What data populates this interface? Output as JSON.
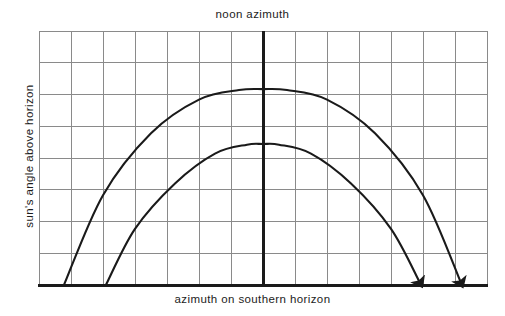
{
  "figure": {
    "type": "diagram",
    "title_top": "noon azimuth",
    "x_axis_label": "azimuth on southern horizon",
    "y_axis_label": "sun's angle above horizon",
    "background_color": "#ffffff",
    "grid": {
      "visible": true,
      "columns": 14,
      "rows": 8,
      "line_color": "#8a8a8a",
      "left": 39,
      "right": 487,
      "top": 31,
      "bottom": 285
    },
    "axes": {
      "horizon_baseline_color": "#1a1a1a",
      "horizon_baseline_thickness": 3,
      "noon_line_color": "#1a1a1a",
      "noon_line_thickness": 3,
      "noon_line_x": 263
    },
    "curves": [
      {
        "name": "summer-sun-path",
        "description": "upper sun path arc, higher maximum altitude, longer day",
        "color": "#1a1a1a",
        "stroke_width": 2.1,
        "start_x": 64,
        "start_y": 285,
        "apex_x": 263,
        "apex_y": 89,
        "end_x": 461,
        "end_y": 283,
        "has_arrowhead": true
      },
      {
        "name": "winter-sun-path",
        "description": "lower sun path arc, lower maximum altitude, shorter day",
        "color": "#1a1a1a",
        "stroke_width": 2.1,
        "start_x": 106,
        "start_y": 285,
        "apex_x": 263,
        "apex_y": 144,
        "end_x": 420,
        "end_y": 283,
        "has_arrowhead": true
      }
    ]
  },
  "chart_data": {
    "type": "line",
    "title": "noon azimuth",
    "xlabel": "azimuth on southern horizon",
    "ylabel": "sun's angle above horizon",
    "grid": true,
    "legend": "none",
    "xlim": [
      0,
      14
    ],
    "ylim": [
      0,
      8
    ],
    "xticklabels": [],
    "yticklabels": [],
    "series": [
      {
        "name": "summer-sun-path",
        "x": [
          0.78,
          2.0,
          3.5,
          5.0,
          6.25,
          7.0,
          7.75,
          9.0,
          10.5,
          12.0,
          13.19
        ],
        "y": [
          0.0,
          2.83,
          4.78,
          5.84,
          6.14,
          6.17,
          6.14,
          5.84,
          4.78,
          2.83,
          0.06
        ]
      },
      {
        "name": "winter-sun-path",
        "x": [
          2.09,
          3.0,
          4.25,
          5.5,
          6.5,
          7.0,
          7.5,
          8.5,
          9.75,
          11.0,
          11.91
        ],
        "y": [
          0.0,
          1.77,
          3.2,
          4.14,
          4.42,
          4.44,
          4.42,
          4.14,
          3.2,
          1.77,
          0.06
        ]
      }
    ],
    "annotations": [
      {
        "text": "noon azimuth",
        "x": 7.0,
        "y": 8.6,
        "type": "top-label"
      },
      {
        "text": "arrowhead",
        "x": 13.19,
        "y": 0.06,
        "type": "marker"
      },
      {
        "text": "arrowhead",
        "x": 11.91,
        "y": 0.06,
        "type": "marker"
      }
    ]
  }
}
